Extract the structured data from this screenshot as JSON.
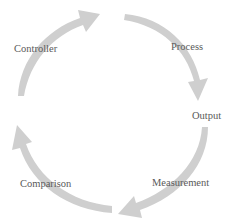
{
  "diagram": {
    "type": "cycle",
    "arrow_color": "#cfcfcf",
    "text_color": "#5a5a5a",
    "steps": [
      {
        "label": "Controller"
      },
      {
        "label": "Process"
      },
      {
        "label": "Output"
      },
      {
        "label": "Measurement"
      },
      {
        "label": "Comparison"
      }
    ],
    "arrows": [
      {
        "from": "Comparison",
        "to": "Controller",
        "direction": "clockwise"
      },
      {
        "from": "Controller",
        "to": "Process",
        "direction": "clockwise"
      },
      {
        "from": "Process",
        "to": "Output",
        "direction": "clockwise"
      },
      {
        "from": "Output",
        "to": "Measurement",
        "direction": "clockwise"
      }
    ]
  }
}
